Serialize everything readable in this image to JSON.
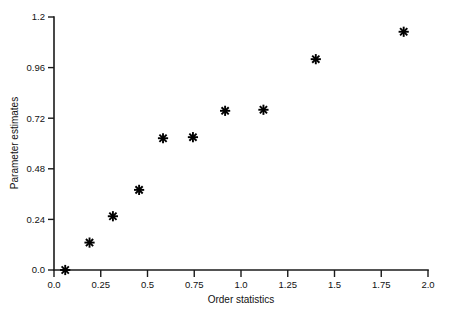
{
  "chart_data": {
    "type": "scatter",
    "title": "",
    "xlabel": "Order statistics",
    "ylabel": "Parameter estimates",
    "xlim": [
      0.0,
      2.0
    ],
    "ylim": [
      0.0,
      1.2
    ],
    "grid": false,
    "legend": null,
    "marker": "asterisk-8-point",
    "marker_color": "#000000",
    "x_ticks": [
      0.0,
      0.25,
      0.5,
      0.75,
      1.0,
      1.25,
      1.5,
      1.75,
      2.0
    ],
    "x_tick_labels": [
      "0.0",
      "0.25",
      "0.5",
      "0.75",
      "1.0",
      "1.25",
      "1.5",
      "1.75",
      "2.0"
    ],
    "y_ticks": [
      0.0,
      0.24,
      0.48,
      0.72,
      0.96,
      1.2
    ],
    "y_tick_labels": [
      "0.0",
      "0.24",
      "0.48",
      "0.72",
      "0.96",
      "1.2"
    ],
    "x": [
      0.06,
      0.19,
      0.315,
      0.455,
      0.583,
      0.743,
      0.915,
      1.12,
      1.4,
      1.87
    ],
    "y": [
      0.0,
      0.13,
      0.255,
      0.38,
      0.625,
      0.63,
      0.755,
      0.76,
      1.0,
      1.13
    ],
    "points": [
      {
        "x": 0.06,
        "y": 0.0
      },
      {
        "x": 0.19,
        "y": 0.13
      },
      {
        "x": 0.315,
        "y": 0.255
      },
      {
        "x": 0.455,
        "y": 0.38
      },
      {
        "x": 0.583,
        "y": 0.625
      },
      {
        "x": 0.743,
        "y": 0.63
      },
      {
        "x": 0.915,
        "y": 0.755
      },
      {
        "x": 1.12,
        "y": 0.76
      },
      {
        "x": 1.4,
        "y": 1.0
      },
      {
        "x": 1.87,
        "y": 1.13
      }
    ]
  },
  "axes": {
    "x_axis_label": "Order statistics",
    "y_axis_label": "Parameter estimates"
  }
}
